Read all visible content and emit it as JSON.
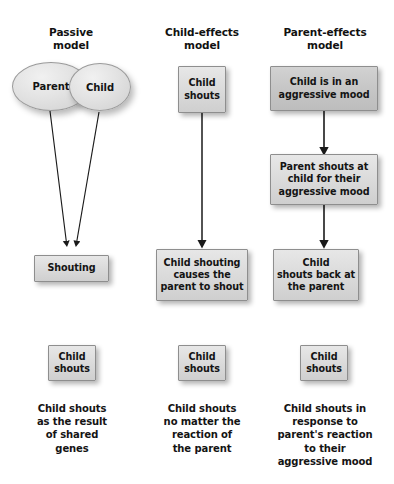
{
  "figure": {
    "background_color": "#ffffff",
    "node_fill": "#dcdcdc",
    "node_border": "#8e8e8e",
    "text_color": "#141414",
    "arrow_color": "#1a1a1a"
  },
  "columns": [
    {
      "id": "passive",
      "header": "Passive\nmodel",
      "ellipses": [
        {
          "label": "Parent"
        },
        {
          "label": "Child"
        }
      ],
      "nodes": [
        {
          "id": "shouting",
          "label": "Shouting"
        }
      ],
      "summary_node": {
        "label": "Child\nshouts"
      },
      "caption": "Child shouts\nas the result\nof shared\ngenes",
      "arrows": [
        {
          "from": "Parent",
          "to": "Shouting"
        },
        {
          "from": "Child",
          "to": "Shouting"
        }
      ]
    },
    {
      "id": "child-effects",
      "header": "Child-effects\nmodel",
      "nodes": [
        {
          "id": "child-shouts",
          "label": "Child\nshouts"
        },
        {
          "id": "child-shouting-causes",
          "label": "Child shouting\ncauses the\nparent to shout"
        }
      ],
      "summary_node": {
        "label": "Child\nshouts"
      },
      "caption": "Child shouts\nno matter the\nreaction of\nthe parent",
      "arrows": [
        {
          "from": "Child shouts",
          "to": "Child shouting causes the parent to shout"
        }
      ]
    },
    {
      "id": "parent-effects",
      "header": "Parent-effects\nmodel",
      "nodes": [
        {
          "id": "aggressive-mood",
          "label": "Child is in an\naggressive mood"
        },
        {
          "id": "parent-shouts-at-child",
          "label": "Parent shouts at\nchild for their\naggressive mood"
        },
        {
          "id": "child-shouts-back",
          "label": "Child\nshouts back at\nthe parent"
        }
      ],
      "summary_node": {
        "label": "Child\nshouts"
      },
      "caption": "Child shouts in\nresponse to\nparent's reaction\nto their\naggressive mood",
      "arrows": [
        {
          "from": "Child is in an aggressive mood",
          "to": "Parent shouts at child for their aggressive mood"
        },
        {
          "from": "Parent shouts at child for their aggressive mood",
          "to": "Child shouts back at the parent"
        }
      ]
    }
  ]
}
